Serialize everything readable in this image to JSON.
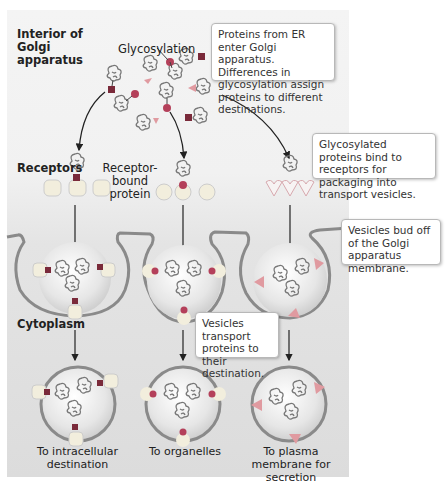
{
  "labels": {
    "interior": "Interior of Golgi apparatus",
    "glycosylation": "Glycosylation",
    "receptors": "Receptors",
    "receptor_bound": "Receptor-bound protein",
    "cytoplasm": "Cytoplasm"
  },
  "callouts": {
    "enter": "Proteins from ER enter Golgi apparatus. Differences in glycosylation assign proteins to different destinations.",
    "bind": "Glycosylated proteins bind to receptors for packaging into transport vesicles.",
    "bud": "Vesicles bud off of the Golgi apparatus membrane.",
    "transport": "Vesicles transport proteins to their destination."
  },
  "destinations": [
    {
      "label": "To intracellular destination",
      "tag_shape": "square",
      "receptor_shape": "rounded-square"
    },
    {
      "label": "To organelles",
      "tag_shape": "circle",
      "receptor_shape": "notched-oval"
    },
    {
      "label": "To plasma membrane for secretion",
      "tag_shape": "triangle",
      "receptor_shape": "heart"
    }
  ],
  "colors": {
    "square_tag": "#7a2a3a",
    "circle_tag": "#b4405a",
    "triangle_tag": "#e09aa0",
    "receptor_fill": "#f2eedd",
    "membrane": "#8a8a8a",
    "vesicle_fill": "#ebebeb",
    "protein": "#7a7a7a"
  }
}
